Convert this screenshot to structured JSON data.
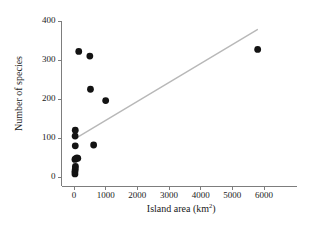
{
  "chart_data": {
    "type": "scatter",
    "title": "",
    "xlabel": "Island area (km2)",
    "xlabel_base": "Island area (km",
    "xlabel_sup": "2",
    "xlabel_close": ")",
    "ylabel": "Number of species",
    "xlim": [
      -400,
      6900
    ],
    "ylim": [
      -30,
      410
    ],
    "xticks": [
      0,
      1000,
      2000,
      3000,
      4000,
      5000,
      6000
    ],
    "xticklabels": [
      "0",
      "1000",
      "2000",
      "3000",
      "4000",
      "5000",
      "6000"
    ],
    "yticks": [
      0,
      100,
      200,
      300,
      400
    ],
    "yticklabels": [
      "0",
      "100",
      "200",
      "300",
      "400"
    ],
    "grid": false,
    "legend": null,
    "marker_color": "#131313",
    "marker_size": 3.4,
    "points": [
      {
        "x": 30,
        "y": 8
      },
      {
        "x": 30,
        "y": 14
      },
      {
        "x": 40,
        "y": 20
      },
      {
        "x": 45,
        "y": 27
      },
      {
        "x": 30,
        "y": 45
      },
      {
        "x": 55,
        "y": 47
      },
      {
        "x": 95,
        "y": 49
      },
      {
        "x": 120,
        "y": 48
      },
      {
        "x": 40,
        "y": 80
      },
      {
        "x": 35,
        "y": 105
      },
      {
        "x": 40,
        "y": 120
      },
      {
        "x": 150,
        "y": 322
      },
      {
        "x": 500,
        "y": 310
      },
      {
        "x": 520,
        "y": 225
      },
      {
        "x": 620,
        "y": 82
      },
      {
        "x": 1000,
        "y": 196
      },
      {
        "x": 5800,
        "y": 327
      }
    ],
    "trendline": {
      "name": "least-squares fit",
      "color": "#b8b8b8",
      "x_start": 130,
      "y_start": 103,
      "x_end": 5790,
      "y_end": 378
    }
  }
}
